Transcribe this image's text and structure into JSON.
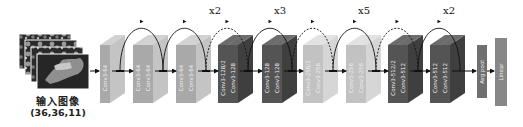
{
  "input": {
    "label": "输入图像",
    "shape": "(36,36,11)"
  },
  "colors": {
    "light": "#a9a9a9",
    "light_side": "#c4c4c4",
    "light_top": "#d2d2d2",
    "lighter": "#c2c2c2",
    "lighter_side": "#d6d6d6",
    "lighter_top": "#e2e2e2",
    "dark": "#545454",
    "dark_side": "#3f3f3f",
    "dark_top": "#6c6c6c",
    "text_on_block": "#f0f0f0",
    "arc": "#111111"
  },
  "repeat_labels": [
    {
      "text": "x2",
      "x": 209,
      "y": 5
    },
    {
      "text": "x3",
      "x": 274,
      "y": 5
    },
    {
      "text": "x5",
      "x": 358,
      "y": 5
    },
    {
      "text": "x2",
      "x": 443,
      "y": 5
    }
  ],
  "blocks": [
    {
      "group": 1,
      "label": "Conv3-64",
      "tone": "light"
    },
    {
      "group": 2,
      "label": "Conv3-64",
      "tone": "light"
    },
    {
      "group": 2,
      "label": "Conv3-64",
      "tone": "light"
    },
    {
      "group": 3,
      "label": "Conv3-64",
      "tone": "light"
    },
    {
      "group": 3,
      "label": "Conv3-64",
      "tone": "light"
    },
    {
      "group": 4,
      "label": "Conv3-128/2",
      "tone": "dark"
    },
    {
      "group": 4,
      "label": "Conv3-128",
      "tone": "dark"
    },
    {
      "group": 5,
      "label": "Conv3-128",
      "tone": "dark"
    },
    {
      "group": 5,
      "label": "Conv3-128",
      "tone": "dark"
    },
    {
      "group": 6,
      "label": "Conv3-256/2",
      "tone": "lighter"
    },
    {
      "group": 6,
      "label": "Conv3-256",
      "tone": "lighter"
    },
    {
      "group": 7,
      "label": "Conv3-256",
      "tone": "lighter"
    },
    {
      "group": 7,
      "label": "Conv3-256",
      "tone": "lighter"
    },
    {
      "group": 8,
      "label": "Conv3-512/2",
      "tone": "dark"
    },
    {
      "group": 8,
      "label": "Conv3-512",
      "tone": "dark"
    },
    {
      "group": 9,
      "label": "Conv3-512",
      "tone": "dark"
    },
    {
      "group": 9,
      "label": "Conv3-512",
      "tone": "dark"
    }
  ],
  "pool": {
    "label": "Avg pool"
  },
  "linear": {
    "label": "Linear"
  },
  "skip_connections": [
    {
      "from_group": 1,
      "to_group": 2,
      "style": "solid"
    },
    {
      "from_group": 2,
      "to_group": 3,
      "style": "solid"
    },
    {
      "from_group": 3,
      "to_group": 4,
      "style": "dashed"
    },
    {
      "from_group": 4,
      "to_group": 5,
      "style": "solid"
    },
    {
      "from_group": 5,
      "to_group": 6,
      "style": "dashed"
    },
    {
      "from_group": 6,
      "to_group": 7,
      "style": "solid"
    },
    {
      "from_group": 7,
      "to_group": 8,
      "style": "dashed"
    },
    {
      "from_group": 8,
      "to_group": 9,
      "style": "solid"
    }
  ]
}
